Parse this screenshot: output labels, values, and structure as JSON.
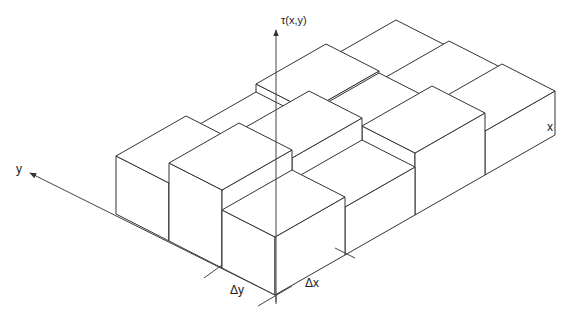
{
  "figure": {
    "type": "3d-histogram-bar-diagram",
    "axes": {
      "x_label": "x",
      "y_label": "y",
      "z_label": "τ(x,y)"
    },
    "increments": {
      "dx_label": "Δx",
      "dy_label": "Δy"
    },
    "grid": {
      "x_cells": 4,
      "y_cells": 3,
      "heights": [
        [
          58,
          48,
          62,
          44
        ],
        [
          78,
          70,
          48,
          40
        ],
        [
          58,
          42,
          50,
          34
        ]
      ]
    },
    "colors": {
      "line": "#333333",
      "face": "#ffffff",
      "background": "#ffffff"
    }
  }
}
